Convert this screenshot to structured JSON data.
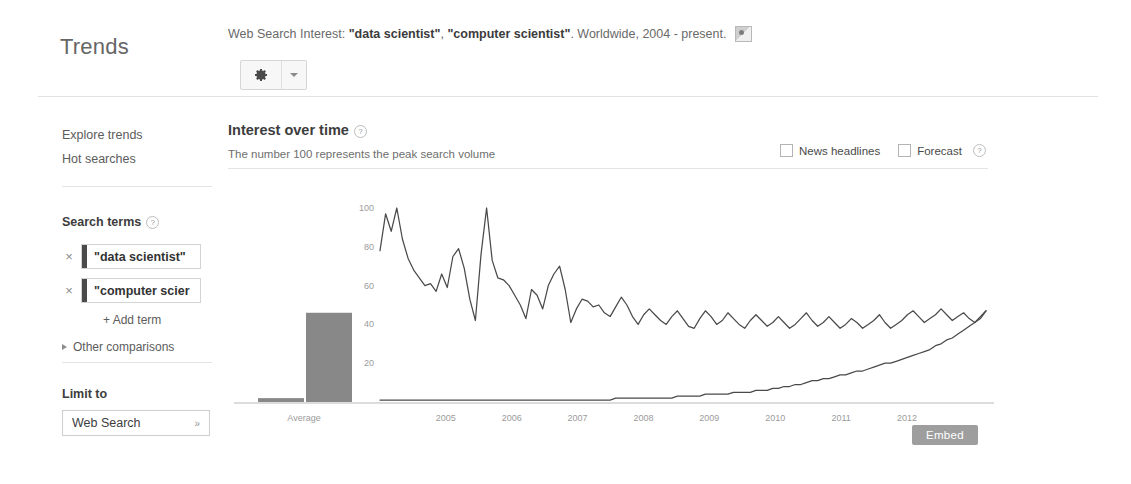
{
  "header": {
    "brand": "Trends",
    "title_prefix": "Web Search Interest: ",
    "term_1": "\"data scientist\"",
    "title_sep": ", ",
    "term_2": "\"computer scientist\"",
    "title_suffix": ". Worldwide, 2004 - present.",
    "embed_thumb_icon": "image-thumbnail-icon",
    "settings_icon": "gear-icon",
    "settings_caret_icon": "chevron-down-icon"
  },
  "sidebar": {
    "explore_trends": "Explore trends",
    "hot_searches": "Hot searches",
    "search_terms_heading": "Search terms",
    "help_glyph": "?",
    "terms": [
      {
        "value": "\"data scientist\"",
        "remove_glyph": "×",
        "swatch": "#4a4a4a"
      },
      {
        "value": "\"computer scier",
        "remove_glyph": "×",
        "swatch": "#4a4a4a"
      }
    ],
    "add_term": "+ Add term",
    "other_comparisons": "Other comparisons",
    "limit_to_heading": "Limit to",
    "limit_value": "Web Search",
    "limit_caret_glyph": "»"
  },
  "main": {
    "section_title": "Interest over time",
    "section_subtitle": "The number 100 represents the peak search volume",
    "help_glyph": "?",
    "news_headlines_label": "News headlines",
    "forecast_label": "Forecast",
    "embed_button": "Embed"
  },
  "chart_data": {
    "type": "line",
    "title": "Interest over time",
    "subtitle": "The number 100 represents the peak search volume",
    "xlabel": "",
    "ylabel": "",
    "ylim": [
      0,
      100
    ],
    "yticks": [
      20,
      40,
      60,
      80,
      100
    ],
    "grid": false,
    "legend": "none",
    "x_tick_labels": [
      "2005",
      "2006",
      "2007",
      "2008",
      "2009",
      "2010",
      "2011",
      "2012"
    ],
    "average_panel": {
      "label": "Average",
      "type": "bar",
      "categories": [
        "\"data scientist\"",
        "\"computer scientist\""
      ],
      "values": [
        2,
        46
      ],
      "color": "#6e6e6e"
    },
    "x_start_year": 2004.0,
    "x_end_year": 2013.2,
    "series": [
      {
        "name": "\"computer scientist\"",
        "color": "#4a4a4a",
        "values": [
          78,
          97,
          88,
          100,
          84,
          74,
          68,
          64,
          60,
          61,
          57,
          66,
          59,
          75,
          79,
          69,
          53,
          42,
          76,
          100,
          73,
          64,
          63,
          60,
          55,
          50,
          43,
          58,
          55,
          48,
          60,
          66,
          70,
          58,
          41,
          48,
          53,
          52,
          49,
          50,
          46,
          44,
          49,
          54,
          50,
          44,
          40,
          45,
          48,
          45,
          42,
          40,
          44,
          47,
          43,
          39,
          38,
          43,
          47,
          44,
          40,
          42,
          46,
          43,
          40,
          38,
          42,
          45,
          42,
          39,
          41,
          44,
          41,
          38,
          40,
          43,
          46,
          42,
          39,
          41,
          44,
          41,
          38,
          40,
          43,
          41,
          38,
          40,
          42,
          45,
          41,
          38,
          40,
          42,
          45,
          47,
          44,
          41,
          43,
          45,
          48,
          45,
          42,
          44,
          46,
          43,
          41,
          44,
          47
        ]
      },
      {
        "name": "\"data scientist\"",
        "color": "#4a4a4a",
        "values": [
          1,
          1,
          1,
          1,
          1,
          1,
          1,
          1,
          1,
          1,
          1,
          1,
          1,
          1,
          1,
          1,
          1,
          1,
          1,
          1,
          1,
          1,
          1,
          1,
          1,
          1,
          1,
          1,
          1,
          1,
          1,
          1,
          1,
          1,
          1,
          1,
          1,
          1,
          1,
          1,
          1,
          1,
          2,
          2,
          2,
          2,
          2,
          2,
          2,
          2,
          2,
          2,
          2,
          3,
          3,
          3,
          3,
          3,
          4,
          4,
          4,
          4,
          4,
          5,
          5,
          5,
          5,
          6,
          6,
          6,
          7,
          7,
          8,
          8,
          9,
          9,
          10,
          11,
          11,
          12,
          12,
          13,
          14,
          14,
          15,
          16,
          16,
          17,
          18,
          19,
          20,
          20,
          21,
          22,
          23,
          24,
          25,
          26,
          27,
          29,
          30,
          32,
          33,
          35,
          37,
          39,
          41,
          43,
          47
        ]
      }
    ]
  }
}
